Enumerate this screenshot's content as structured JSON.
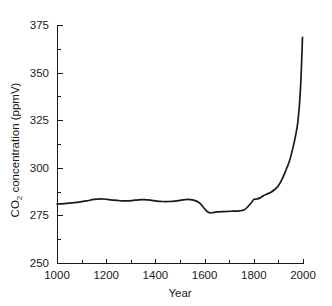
{
  "chart_data": {
    "type": "line",
    "title": "",
    "xlabel": "Year",
    "ylabel_main": "CO",
    "ylabel_sub": "2",
    "ylabel_rest": " concentration (ppmV)",
    "ylabel_full": "CO2 concentration (ppmV)",
    "xlim": [
      1000,
      2000
    ],
    "ylim": [
      250,
      375
    ],
    "grid": false,
    "legend": "none",
    "line_color": "#1a1a1a",
    "background_color": "#ffffff",
    "x_ticks_major": [
      1000,
      1200,
      1400,
      1600,
      1800,
      2000
    ],
    "x_ticks_major_labels": [
      "1000",
      "1200",
      "1400",
      "1600",
      "1800",
      "2000"
    ],
    "x_ticks_minor": [
      1100,
      1300,
      1500,
      1700,
      1900
    ],
    "y_ticks_major": [
      250,
      275,
      300,
      325,
      350,
      375
    ],
    "y_ticks_major_labels": [
      "250",
      "275",
      "300",
      "325",
      "350",
      "375"
    ],
    "y_ticks_minor": [
      262.5,
      287.5,
      312.5,
      337.5,
      362.5
    ],
    "series": [
      {
        "name": "CO2 concentration",
        "x": [
          1000,
          1030,
          1060,
          1090,
          1120,
          1150,
          1180,
          1205,
          1230,
          1255,
          1280,
          1305,
          1330,
          1355,
          1380,
          1405,
          1430,
          1455,
          1480,
          1505,
          1530,
          1555,
          1580,
          1600,
          1615,
          1630,
          1650,
          1680,
          1710,
          1740,
          1760,
          1775,
          1790,
          1800,
          1812,
          1825,
          1840,
          1855,
          1870,
          1885,
          1900,
          1915,
          1930,
          1945,
          1960,
          1970,
          1980,
          1990,
          1998
        ],
        "y": [
          281.0,
          281.2,
          281.6,
          282.0,
          282.6,
          283.4,
          283.7,
          283.4,
          283.0,
          282.7,
          282.6,
          282.8,
          283.2,
          283.3,
          283.0,
          282.5,
          282.3,
          282.3,
          282.5,
          283.0,
          283.4,
          283.0,
          281.5,
          278.5,
          276.6,
          276.4,
          276.8,
          277.0,
          277.2,
          277.4,
          277.8,
          279.5,
          281.6,
          283.4,
          283.6,
          284.2,
          285.4,
          286.3,
          287.2,
          288.6,
          290.6,
          294.0,
          298.6,
          303.6,
          311.0,
          317.0,
          325.0,
          342.0,
          368.5
        ]
      }
    ]
  },
  "axes_geometry": {
    "plot_left": 57,
    "plot_right": 303,
    "plot_top": 25,
    "plot_bottom": 263
  }
}
